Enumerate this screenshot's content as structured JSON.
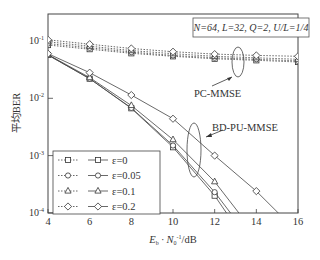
{
  "chart_data": {
    "type": "line",
    "title": "",
    "xlabel": "E_b · N_0^-1/dB",
    "ylabel": "平均BER",
    "xlim": [
      4,
      16
    ],
    "ylim": [
      0.0001,
      0.3
    ],
    "yscale": "log",
    "x_ticks": [
      "4",
      "6",
      "8",
      "10",
      "12",
      "14",
      "16"
    ],
    "y_ticks": [
      "10^-1",
      "10^-2",
      "10^-3",
      "10^-4"
    ],
    "grid": false,
    "annotation_box": "N=64, L=32, Q=2, U/L=1/4",
    "annotations": [
      "PC-MMSE",
      "BD-PU-MMSE"
    ],
    "legend_position": "lower left",
    "legend": [
      {
        "label": "ε=0",
        "marker": "square"
      },
      {
        "label": "ε=0.05",
        "marker": "circle"
      },
      {
        "label": "ε=0.1",
        "marker": "triangle"
      },
      {
        "label": "ε=0.2",
        "marker": "diamond"
      }
    ],
    "x": [
      4,
      6,
      8,
      10,
      12,
      14,
      16
    ],
    "series": [
      {
        "name": "PC-MMSE ε=0",
        "style": "dotted",
        "marker": "square",
        "values": [
          0.085,
          0.072,
          0.061,
          0.054,
          0.049,
          0.046,
          0.043
        ]
      },
      {
        "name": "PC-MMSE ε=0.05",
        "style": "dotted",
        "marker": "circle",
        "values": [
          0.09,
          0.076,
          0.064,
          0.056,
          0.051,
          0.048,
          0.045
        ]
      },
      {
        "name": "PC-MMSE ε=0.1",
        "style": "dotted",
        "marker": "triangle",
        "values": [
          0.097,
          0.081,
          0.068,
          0.06,
          0.054,
          0.051,
          0.048
        ]
      },
      {
        "name": "PC-MMSE ε=0.2",
        "style": "dotted",
        "marker": "diamond",
        "values": [
          0.105,
          0.088,
          0.074,
          0.065,
          0.059,
          0.056,
          0.054
        ]
      },
      {
        "name": "BD-PU-MMSE ε=0",
        "style": "solid",
        "marker": "square",
        "values": [
          0.057,
          0.022,
          0.0067,
          0.0014,
          0.0002,
          null,
          null
        ]
      },
      {
        "name": "BD-PU-MMSE ε=0.05",
        "style": "solid",
        "marker": "circle",
        "values": [
          0.057,
          0.022,
          0.0068,
          0.0015,
          0.00023,
          null,
          null
        ]
      },
      {
        "name": "BD-PU-MMSE ε=0.1",
        "style": "solid",
        "marker": "triangle",
        "values": [
          0.058,
          0.023,
          0.0075,
          0.0019,
          0.00035,
          null,
          null
        ]
      },
      {
        "name": "BD-PU-MMSE ε=0.2",
        "style": "solid",
        "marker": "diamond",
        "values": [
          0.06,
          0.028,
          0.0114,
          0.0044,
          0.001,
          0.00024,
          null
        ]
      }
    ]
  },
  "labels": {
    "ylabel": "平均BER",
    "xlabel_main": "E",
    "xlabel_sub1": "b",
    "xlabel_mid": " · N",
    "xlabel_sub2": "0",
    "xlabel_sup": "-1",
    "xlabel_tail": "/dB",
    "param_box": "N=64, L=32, Q=2, U/L=1/4",
    "pc_mmse": "PC-MMSE",
    "bd_pu_mmse": "BD-PU-MMSE"
  }
}
